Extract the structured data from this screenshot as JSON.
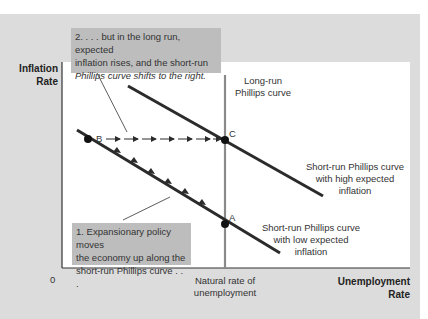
{
  "axes": {
    "y_label_line1": "Inflation",
    "y_label_line2": "Rate",
    "x_label_line1": "Unemployment",
    "x_label_line2": "Rate",
    "origin": "0",
    "x_tick_line1": "Natural rate of",
    "x_tick_line2": "unemployment"
  },
  "curves": {
    "lrpc_line1": "Long-run",
    "lrpc_line2": "Phillips curve",
    "srpc_high_line1": "Short-run Phillips curve",
    "srpc_high_line2": "with high expected",
    "srpc_high_line3": "inflation",
    "srpc_low_line1": "Short-run Phillips curve",
    "srpc_low_line2": "with low expected",
    "srpc_low_line3": "inflation"
  },
  "points": {
    "a": "A",
    "b": "B",
    "c": "C"
  },
  "annotations": {
    "step2_line1": "2. . . . but in the long run, expected",
    "step2_line2": "inflation rises, and the short-run",
    "step2_line3": "Phillips curve shifts to the right.",
    "step1_line1": "1. Expansionary policy moves",
    "step1_line2": "the economy up along the",
    "step1_line3": "short-run Phillips curve . . ."
  },
  "colors": {
    "panel": "#dcdcdc",
    "plot": "#ffffff",
    "curve": "#2b2b2b",
    "lrpc": "#8a8a8a",
    "annotation_box": "#bdbdbd"
  }
}
